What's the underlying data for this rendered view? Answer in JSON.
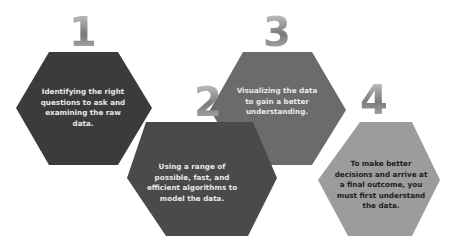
{
  "steps": [
    {
      "number": "1",
      "text": "Identifying the right questions to ask and examining the raw data.",
      "color": "#3b3b3b"
    },
    {
      "number": "2",
      "text": "Using a range of possible, fast, and efficient algorithms to model the data.",
      "color": "#4a4a4a"
    },
    {
      "number": "3",
      "text": "Visualizing the data to gain a better understanding.",
      "color": "#6b6b6b"
    },
    {
      "number": "4",
      "text": "To make better decisions and arrive at a final outcome, you must first understand the data.",
      "color": "#9c9c9c"
    }
  ]
}
